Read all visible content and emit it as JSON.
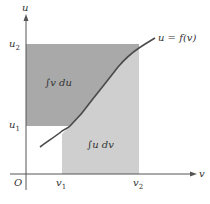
{
  "diagram": {
    "axes": {
      "x_label": "v",
      "y_label": "u",
      "origin_label": "O"
    },
    "ticks": {
      "v1": {
        "base": "v",
        "sub": "1"
      },
      "v2": {
        "base": "v",
        "sub": "2"
      },
      "u1": {
        "base": "u",
        "sub": "1"
      },
      "u2": {
        "base": "u",
        "sub": "2"
      }
    },
    "curve_label": "u = f(v)",
    "regions": {
      "upper": {
        "label": "∫v du",
        "color": "#a9a9a9"
      },
      "lower": {
        "label": "∫u dv",
        "color": "#cfcfcf"
      }
    },
    "colors": {
      "curve": "#4a4a4a",
      "axis": "#555555",
      "text": "#333333"
    }
  }
}
